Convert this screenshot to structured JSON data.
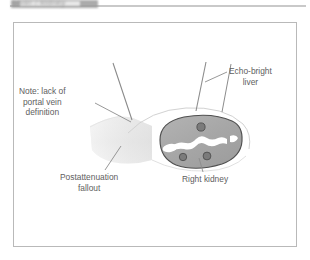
{
  "header": {
    "title": "Liver / kidney",
    "rule_color": "#c9c9c9",
    "block_color": "#9d9d9d"
  },
  "figure": {
    "frame_border_color": "#b9b9b9",
    "background": "#ffffff",
    "labels": {
      "note_line1": "Note: lack of",
      "note_line2": "portal vein",
      "note_line3": "definition",
      "echo_bright_line1": "Echo-bright",
      "echo_bright_line2": "liver",
      "fallout_line1": "Postattenuation",
      "fallout_line2": "fallout",
      "right_kidney": "Right kidney"
    },
    "colors": {
      "text": "#5e5e5e",
      "leader_line": "#8c8c8c",
      "outline_dark": "#555555",
      "kidney_fill": "#a8a8a8",
      "kidney_sinus": "#ffffff",
      "kidney_vessel": "#7d7d7d",
      "fallout_light": "#f2f2f2",
      "fallout_mid": "#e2e2e2",
      "liver_arc": "#d8d8d8"
    },
    "icons": {
      "kidney": "kidney-shape",
      "fallout": "attenuation-wedge",
      "liver": "liver-arc"
    }
  }
}
